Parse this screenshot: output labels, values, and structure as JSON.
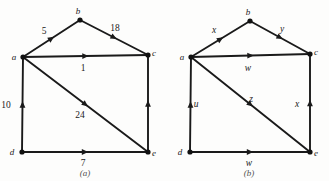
{
  "figure": {
    "panels": [
      {
        "caption": "(a)",
        "vertices": [
          {
            "id": "a",
            "label": "a",
            "x": 23,
            "y": 57,
            "label_dx": -9,
            "label_dy": 3
          },
          {
            "id": "b",
            "label": "b",
            "x": 80,
            "y": 20,
            "label_dx": -2,
            "label_dy": -6
          },
          {
            "id": "c",
            "label": "c",
            "x": 148,
            "y": 55,
            "label_dx": 6,
            "label_dy": 1
          },
          {
            "id": "d",
            "label": "d",
            "x": 22,
            "y": 152,
            "label_dx": -10,
            "label_dy": 3
          },
          {
            "id": "e",
            "label": "e",
            "x": 148,
            "y": 152,
            "label_dx": 6,
            "label_dy": 4
          }
        ],
        "edges": [
          {
            "from": "a",
            "to": "b",
            "weight": "5",
            "wx": 44,
            "wy": 34,
            "italic": false
          },
          {
            "from": "b",
            "to": "c",
            "weight": "18",
            "wx": 115,
            "wy": 31,
            "italic": false
          },
          {
            "from": "a",
            "to": "c",
            "weight": "1",
            "wx": 83,
            "wy": 71,
            "italic": false
          },
          {
            "from": "d",
            "to": "a",
            "weight": "10",
            "wx": 6,
            "wy": 108,
            "italic": false
          },
          {
            "from": "a",
            "to": "e",
            "weight": "24",
            "wx": 80,
            "wy": 118,
            "italic": false
          },
          {
            "from": "d",
            "to": "e",
            "weight": "7",
            "wx": 83,
            "wy": 166,
            "italic": false
          },
          {
            "from": "e",
            "to": "c",
            "weight": "",
            "wx": 0,
            "wy": 0,
            "italic": false
          }
        ]
      },
      {
        "caption": "(b)",
        "vertices": [
          {
            "id": "a",
            "label": "a",
            "x": 27,
            "y": 57,
            "label_dx": -9,
            "label_dy": 3
          },
          {
            "id": "b",
            "label": "b",
            "x": 86,
            "y": 21,
            "label_dx": -2,
            "label_dy": -6
          },
          {
            "id": "c",
            "label": "c",
            "x": 146,
            "y": 54,
            "label_dx": 6,
            "label_dy": 1
          },
          {
            "id": "d",
            "label": "d",
            "x": 26,
            "y": 152,
            "label_dx": -10,
            "label_dy": 3
          },
          {
            "id": "e",
            "label": "e",
            "x": 146,
            "y": 152,
            "label_dx": 6,
            "label_dy": 4
          }
        ],
        "edges": [
          {
            "from": "a",
            "to": "b",
            "weight": "x",
            "wx": 50,
            "wy": 33,
            "italic": true
          },
          {
            "from": "b",
            "to": "c",
            "weight": "y",
            "wx": 118,
            "wy": 32,
            "italic": true
          },
          {
            "from": "a",
            "to": "c",
            "weight": "w",
            "wx": 84,
            "wy": 71,
            "italic": true
          },
          {
            "from": "d",
            "to": "a",
            "weight": "u",
            "wx": 32,
            "wy": 107,
            "italic": true
          },
          {
            "from": "a",
            "to": "e",
            "weight": "z",
            "wx": 87,
            "wy": 102,
            "italic": true
          },
          {
            "from": "d",
            "to": "e",
            "weight": "w",
            "wx": 85,
            "wy": 166,
            "italic": true
          },
          {
            "from": "e",
            "to": "c",
            "weight": "x",
            "wx": 133,
            "wy": 107,
            "italic": true
          }
        ]
      }
    ]
  }
}
